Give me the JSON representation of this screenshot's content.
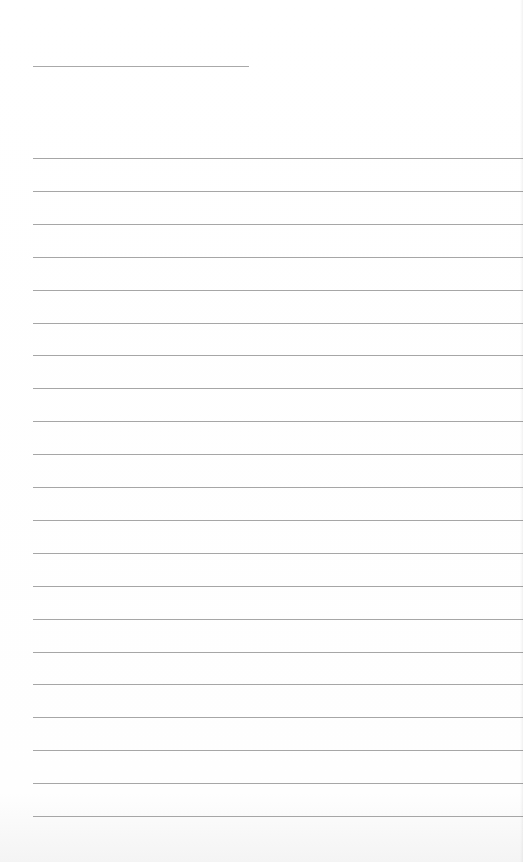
{
  "page": {
    "type": "lined-paper",
    "background_color": "#fdfdfd",
    "line_color": "#a6a6a6",
    "title_line": {
      "x": 33,
      "y": 66,
      "width": 216
    },
    "ruled_lines": {
      "count": 21,
      "start_y": 158,
      "spacing": 32.9,
      "x": 33
    }
  }
}
